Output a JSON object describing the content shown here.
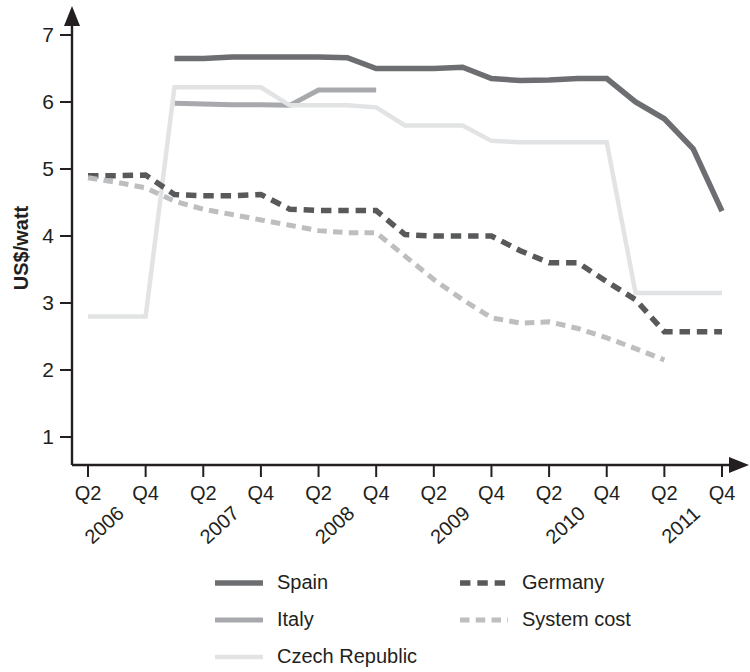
{
  "chart_data": {
    "type": "line",
    "title": "",
    "subtitle": "",
    "xlabel": "",
    "ylabel": "US$/watt",
    "ylim": [
      0.3,
      7.4
    ],
    "yticks": [
      1,
      2,
      3,
      4,
      5,
      6,
      7
    ],
    "ytick_labels": [
      "1",
      "2",
      "3",
      "4",
      "5",
      "6",
      "7"
    ],
    "grid": false,
    "legend_position": "bottom",
    "x": [
      "Q2 2006",
      "Q3 2006",
      "Q4 2006",
      "Q1 2007",
      "Q2 2007",
      "Q3 2007",
      "Q4 2007",
      "Q1 2008",
      "Q2 2008",
      "Q3 2008",
      "Q4 2008",
      "Q1 2009",
      "Q2 2009",
      "Q3 2009",
      "Q4 2009",
      "Q1 2010",
      "Q2 2010",
      "Q3 2010",
      "Q4 2010",
      "Q1 2011",
      "Q2 2011",
      "Q3 2011",
      "Q4 2011"
    ],
    "xtick_labels": [
      "Q2",
      "Q4",
      "Q2",
      "Q4",
      "Q2",
      "Q4",
      "Q2",
      "Q4",
      "Q2",
      "Q4",
      "Q2",
      "Q4"
    ],
    "xtick_positions": [
      "Q2 2006",
      "Q4 2006",
      "Q2 2007",
      "Q4 2007",
      "Q2 2008",
      "Q4 2008",
      "Q2 2009",
      "Q4 2009",
      "Q2 2010",
      "Q4 2010",
      "Q2 2011",
      "Q4 2011"
    ],
    "year_labels": [
      "2006",
      "2007",
      "2008",
      "2009",
      "2010",
      "2011"
    ],
    "series": [
      {
        "name": "Spain",
        "color": "#6d6e71",
        "style": "solid",
        "width": 5.5,
        "points": [
          {
            "x": "Q1 2007",
            "y": 6.65
          },
          {
            "x": "Q2 2007",
            "y": 6.65
          },
          {
            "x": "Q3 2007",
            "y": 6.67
          },
          {
            "x": "Q4 2007",
            "y": 6.67
          },
          {
            "x": "Q1 2008",
            "y": 6.67
          },
          {
            "x": "Q2 2008",
            "y": 6.67
          },
          {
            "x": "Q3 2008",
            "y": 6.66
          },
          {
            "x": "Q4 2008",
            "y": 6.5
          },
          {
            "x": "Q1 2009",
            "y": 6.5
          },
          {
            "x": "Q2 2009",
            "y": 6.5
          },
          {
            "x": "Q3 2009",
            "y": 6.52
          },
          {
            "x": "Q4 2009",
            "y": 6.35
          },
          {
            "x": "Q1 2010",
            "y": 6.32
          },
          {
            "x": "Q2 2010",
            "y": 6.33
          },
          {
            "x": "Q3 2010",
            "y": 6.35
          },
          {
            "x": "Q4 2010",
            "y": 6.35
          },
          {
            "x": "Q1 2011",
            "y": 6.0
          },
          {
            "x": "Q2 2011",
            "y": 5.75
          },
          {
            "x": "Q3 2011",
            "y": 5.3
          },
          {
            "x": "Q4 2011",
            "y": 4.37
          }
        ]
      },
      {
        "name": "Italy",
        "color": "#a7a9ac",
        "style": "solid",
        "width": 5.0,
        "points": [
          {
            "x": "Q1 2007",
            "y": 5.98
          },
          {
            "x": "Q2 2007",
            "y": 5.97
          },
          {
            "x": "Q3 2007",
            "y": 5.96
          },
          {
            "x": "Q4 2007",
            "y": 5.96
          },
          {
            "x": "Q1 2008",
            "y": 5.95
          },
          {
            "x": "Q2 2008",
            "y": 6.18
          },
          {
            "x": "Q3 2008",
            "y": 6.18
          },
          {
            "x": "Q4 2008",
            "y": 6.18
          }
        ]
      },
      {
        "name": "Czech Republic",
        "color": "#e2e3e4",
        "style": "solid",
        "width": 4.5,
        "points": [
          {
            "x": "Q2 2006",
            "y": 2.8
          },
          {
            "x": "Q3 2006",
            "y": 2.8
          },
          {
            "x": "Q4 2006",
            "y": 2.8
          },
          {
            "x": "Q1 2007",
            "y": 6.22
          },
          {
            "x": "Q2 2007",
            "y": 6.22
          },
          {
            "x": "Q3 2007",
            "y": 6.22
          },
          {
            "x": "Q4 2007",
            "y": 6.22
          },
          {
            "x": "Q1 2008",
            "y": 5.95
          },
          {
            "x": "Q2 2008",
            "y": 5.95
          },
          {
            "x": "Q3 2008",
            "y": 5.95
          },
          {
            "x": "Q4 2008",
            "y": 5.92
          },
          {
            "x": "Q1 2009",
            "y": 5.65
          },
          {
            "x": "Q2 2009",
            "y": 5.65
          },
          {
            "x": "Q3 2009",
            "y": 5.65
          },
          {
            "x": "Q4 2009",
            "y": 5.42
          },
          {
            "x": "Q1 2010",
            "y": 5.4
          },
          {
            "x": "Q2 2010",
            "y": 5.4
          },
          {
            "x": "Q3 2010",
            "y": 5.4
          },
          {
            "x": "Q4 2010",
            "y": 5.4
          },
          {
            "x": "Q1 2011",
            "y": 3.15
          },
          {
            "x": "Q2 2011",
            "y": 3.15
          },
          {
            "x": "Q3 2011",
            "y": 3.15
          },
          {
            "x": "Q4 2011",
            "y": 3.15
          }
        ]
      },
      {
        "name": "Germany",
        "color": "#58595b",
        "style": "dashed",
        "width": 5.5,
        "points": [
          {
            "x": "Q2 2006",
            "y": 4.9
          },
          {
            "x": "Q3 2006",
            "y": 4.9
          },
          {
            "x": "Q4 2006",
            "y": 4.91
          },
          {
            "x": "Q1 2007",
            "y": 4.62
          },
          {
            "x": "Q2 2007",
            "y": 4.6
          },
          {
            "x": "Q3 2007",
            "y": 4.6
          },
          {
            "x": "Q4 2007",
            "y": 4.62
          },
          {
            "x": "Q1 2008",
            "y": 4.4
          },
          {
            "x": "Q2 2008",
            "y": 4.38
          },
          {
            "x": "Q3 2008",
            "y": 4.38
          },
          {
            "x": "Q4 2008",
            "y": 4.38
          },
          {
            "x": "Q1 2009",
            "y": 4.02
          },
          {
            "x": "Q2 2009",
            "y": 4.0
          },
          {
            "x": "Q3 2009",
            "y": 4.0
          },
          {
            "x": "Q4 2009",
            "y": 4.0
          },
          {
            "x": "Q1 2010",
            "y": 3.78
          },
          {
            "x": "Q2 2010",
            "y": 3.6
          },
          {
            "x": "Q3 2010",
            "y": 3.6
          },
          {
            "x": "Q4 2010",
            "y": 3.32
          },
          {
            "x": "Q1 2011",
            "y": 3.05
          },
          {
            "x": "Q2 2011",
            "y": 2.57
          },
          {
            "x": "Q3 2011",
            "y": 2.57
          },
          {
            "x": "Q4 2011",
            "y": 2.57
          }
        ]
      },
      {
        "name": "System cost",
        "color": "#bcbec0",
        "style": "dashed",
        "width": 5.0,
        "points": [
          {
            "x": "Q2 2006",
            "y": 4.87
          },
          {
            "x": "Q3 2006",
            "y": 4.8
          },
          {
            "x": "Q4 2006",
            "y": 4.72
          },
          {
            "x": "Q1 2007",
            "y": 4.52
          },
          {
            "x": "Q2 2007",
            "y": 4.4
          },
          {
            "x": "Q3 2007",
            "y": 4.32
          },
          {
            "x": "Q4 2007",
            "y": 4.24
          },
          {
            "x": "Q1 2008",
            "y": 4.16
          },
          {
            "x": "Q2 2008",
            "y": 4.08
          },
          {
            "x": "Q3 2008",
            "y": 4.05
          },
          {
            "x": "Q4 2008",
            "y": 4.05
          },
          {
            "x": "Q1 2009",
            "y": 3.7
          },
          {
            "x": "Q2 2009",
            "y": 3.35
          },
          {
            "x": "Q3 2009",
            "y": 3.05
          },
          {
            "x": "Q4 2009",
            "y": 2.78
          },
          {
            "x": "Q1 2010",
            "y": 2.7
          },
          {
            "x": "Q2 2010",
            "y": 2.72
          },
          {
            "x": "Q3 2010",
            "y": 2.62
          },
          {
            "x": "Q4 2010",
            "y": 2.48
          },
          {
            "x": "Q1 2011",
            "y": 2.32
          },
          {
            "x": "Q2 2011",
            "y": 2.15
          }
        ]
      }
    ],
    "legend": [
      {
        "name": "Spain",
        "color": "#6d6e71",
        "style": "solid"
      },
      {
        "name": "Germany",
        "color": "#58595b",
        "style": "dashed"
      },
      {
        "name": "Italy",
        "color": "#a7a9ac",
        "style": "solid"
      },
      {
        "name": "System cost",
        "color": "#bcbec0",
        "style": "dashed"
      },
      {
        "name": "Czech Republic",
        "color": "#e2e3e4",
        "style": "solid"
      }
    ]
  }
}
